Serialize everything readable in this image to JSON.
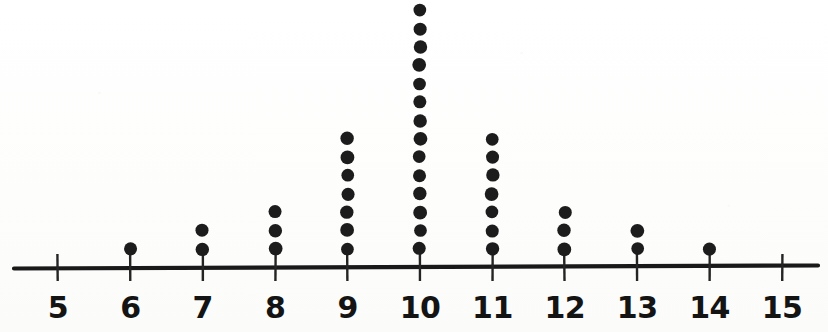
{
  "chart_data": {
    "type": "dotplot",
    "title": "",
    "subtitle": "",
    "xlabel": "",
    "ylabel": "",
    "categories": [
      "5",
      "6",
      "7",
      "8",
      "9",
      "10",
      "11",
      "12",
      "13",
      "14",
      "15"
    ],
    "values": [
      0,
      1,
      2,
      3,
      7,
      14,
      7,
      3,
      2,
      1,
      0
    ],
    "x": [
      5,
      6,
      7,
      8,
      9,
      10,
      11,
      12,
      13,
      14,
      15
    ],
    "counts": [
      0,
      1,
      2,
      3,
      7,
      14,
      7,
      3,
      2,
      1,
      0
    ],
    "total_count": 40,
    "xlim": [
      5,
      15
    ],
    "ylim": [
      0,
      14
    ],
    "grid": false,
    "legend": null,
    "annotations": [],
    "tick_labels": [
      "5",
      "6",
      "7",
      "8",
      "9",
      "10",
      "11",
      "12",
      "13",
      "14",
      "15"
    ],
    "dot_color": "#1c1c1c",
    "axis_color": "#191919",
    "background_color": "#fefefe"
  },
  "axis": {
    "tick_labels": [
      "5",
      "6",
      "7",
      "8",
      "9",
      "10",
      "11",
      "12",
      "13",
      "14",
      "15"
    ]
  },
  "geometry": {
    "axis_y": 267,
    "axis_x_start": 14,
    "axis_x_end": 818,
    "first_tick_x": 58,
    "tick_spacing": 72.4,
    "dot_radius": 6.6,
    "dot_spacing": 18.35,
    "first_dot_offset": 18,
    "tick_top": 254,
    "tick_bottom": 281,
    "label_y": 318
  }
}
